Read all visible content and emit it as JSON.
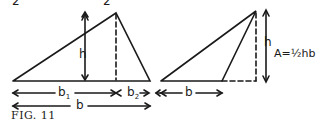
{
  "figure": {
    "caption": "FIG. 11",
    "top_marks": [
      "2",
      "2"
    ],
    "left_triangle": {
      "height_label": "h",
      "base1_label": "b",
      "base1_sub": "1",
      "base2_label": "b",
      "base2_sub": "2",
      "base_label": "b"
    },
    "right_triangle": {
      "height_label": "h",
      "base_label": "b",
      "formula": "A=½hb"
    },
    "colors": {
      "ink": "#1a1a1a",
      "background": "#ffffff"
    }
  }
}
